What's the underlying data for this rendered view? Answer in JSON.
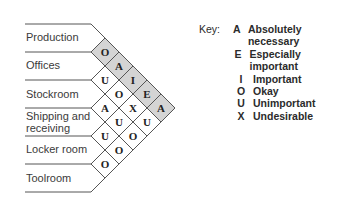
{
  "departments": [
    {
      "name": "Production"
    },
    {
      "name": "Offices"
    },
    {
      "name": "Stockroom"
    },
    {
      "name": "Shipping and receiving",
      "lines": [
        "Shipping and",
        "receiving"
      ]
    },
    {
      "name": "Locker room"
    },
    {
      "name": "Toolroom"
    }
  ],
  "relationships": [
    {
      "pair": [
        "Production",
        "Offices"
      ],
      "code": "O",
      "shaded": true
    },
    {
      "pair": [
        "Offices",
        "Stockroom"
      ],
      "code": "U",
      "shaded": false
    },
    {
      "pair": [
        "Stockroom",
        "Shipping and receiving"
      ],
      "code": "A",
      "shaded": false
    },
    {
      "pair": [
        "Shipping and receiving",
        "Locker room"
      ],
      "code": "U",
      "shaded": false
    },
    {
      "pair": [
        "Locker room",
        "Toolroom"
      ],
      "code": "O",
      "shaded": false
    },
    {
      "pair": [
        "Production",
        "Stockroom"
      ],
      "code": "A",
      "shaded": true
    },
    {
      "pair": [
        "Offices",
        "Shipping and receiving"
      ],
      "code": "O",
      "shaded": false
    },
    {
      "pair": [
        "Stockroom",
        "Locker room"
      ],
      "code": "U",
      "shaded": false
    },
    {
      "pair": [
        "Shipping and receiving",
        "Toolroom"
      ],
      "code": "O",
      "shaded": false
    },
    {
      "pair": [
        "Production",
        "Shipping and receiving"
      ],
      "code": "I",
      "shaded": true
    },
    {
      "pair": [
        "Offices",
        "Locker room"
      ],
      "code": "X",
      "shaded": false
    },
    {
      "pair": [
        "Stockroom",
        "Toolroom"
      ],
      "code": "O",
      "shaded": false
    },
    {
      "pair": [
        "Production",
        "Locker room"
      ],
      "code": "E",
      "shaded": true
    },
    {
      "pair": [
        "Offices",
        "Toolroom"
      ],
      "code": "U",
      "shaded": false
    },
    {
      "pair": [
        "Production",
        "Toolroom"
      ],
      "code": "A",
      "shaded": true
    }
  ],
  "key": {
    "title": "Key:",
    "items": [
      {
        "code": "A",
        "desc": "Absolutely necessary"
      },
      {
        "code": "E",
        "desc": "Especially important"
      },
      {
        "code": "I",
        "desc": "Important"
      },
      {
        "code": "O",
        "desc": "Okay"
      },
      {
        "code": "U",
        "desc": "Unimportant"
      },
      {
        "code": "X",
        "desc": "Undesirable"
      }
    ]
  },
  "colors": {
    "shaded": "#d4d4d4",
    "line": "#555555",
    "background": "#ffffff"
  }
}
